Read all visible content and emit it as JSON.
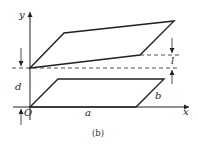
{
  "figure": {
    "caption": "(b)",
    "colors": {
      "stroke": "#222222",
      "background": "#ffffff"
    }
  },
  "axes": {
    "x_label": "x",
    "y_label": "y",
    "origin_label": "O"
  },
  "dimensions": {
    "a_label": "a",
    "b_label": "b",
    "d_label": "d",
    "l_label": "l"
  },
  "shapes": {
    "upper_plate": {
      "points": "30,68 64,33 174,21 140,55"
    },
    "lower_plate": {
      "points": "30,107 58,79 164,79 136,107"
    }
  }
}
